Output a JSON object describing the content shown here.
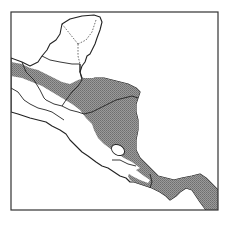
{
  "map": {
    "title": "",
    "region": "Central America",
    "legend": [],
    "colors": {
      "range_fill": "#8a8a8a",
      "outline": "#222222",
      "background": "#ffffff"
    },
    "features": [
      {
        "name": "shaded-distribution-range",
        "style": "stippled gray"
      },
      {
        "name": "yucatan-peninsula",
        "borders": "dashed"
      },
      {
        "name": "guatemala"
      },
      {
        "name": "belize"
      },
      {
        "name": "honduras"
      },
      {
        "name": "el-salvador"
      },
      {
        "name": "nicaragua"
      },
      {
        "name": "lake-nicaragua"
      },
      {
        "name": "costa-rica"
      },
      {
        "name": "panama"
      }
    ]
  }
}
